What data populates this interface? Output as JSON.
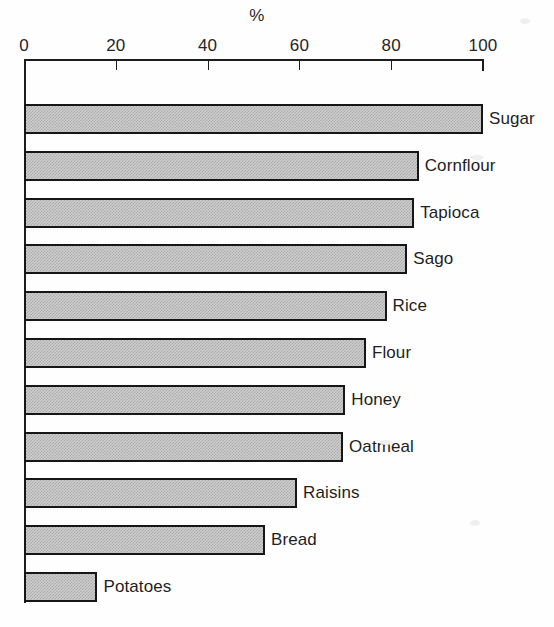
{
  "chart_data": {
    "type": "bar",
    "orientation": "horizontal",
    "title": "",
    "unit_label": "%",
    "xlabel": "%",
    "ylabel": "",
    "xlim": [
      0,
      100
    ],
    "xticks": [
      0,
      20,
      40,
      60,
      80,
      100
    ],
    "xtick_labels": [
      "0",
      "20",
      "40",
      "60",
      "80",
      "100"
    ],
    "grid": false,
    "legend": "none",
    "categories": [
      "Sugar",
      "Cornflour",
      "Tapioca",
      "Sago",
      "Rice",
      "Flour",
      "Honey",
      "Oatmeal",
      "Raisins",
      "Bread",
      "Potatoes"
    ],
    "values": [
      100,
      86,
      85,
      83.5,
      79,
      74.5,
      70,
      69.5,
      59.5,
      52.5,
      16
    ],
    "bars": [
      {
        "label": "Sugar",
        "value": 100
      },
      {
        "label": "Cornflour",
        "value": 86
      },
      {
        "label": "Tapioca",
        "value": 85
      },
      {
        "label": "Sago",
        "value": 83.5
      },
      {
        "label": "Rice",
        "value": 79
      },
      {
        "label": "Flour",
        "value": 74.5
      },
      {
        "label": "Honey",
        "value": 70
      },
      {
        "label": "Oatmeal",
        "value": 69.5
      },
      {
        "label": "Raisins",
        "value": 59.5
      },
      {
        "label": "Bread",
        "value": 52.5
      },
      {
        "label": "Potatoes",
        "value": 16
      }
    ],
    "colors": {
      "bar_fill": "#cfcfcf",
      "bar_pattern": "#a9a9a9",
      "bar_border": "#161616",
      "axis": "#1d1d1d",
      "text": "#1f1f1f",
      "background": "#fefefe"
    }
  }
}
